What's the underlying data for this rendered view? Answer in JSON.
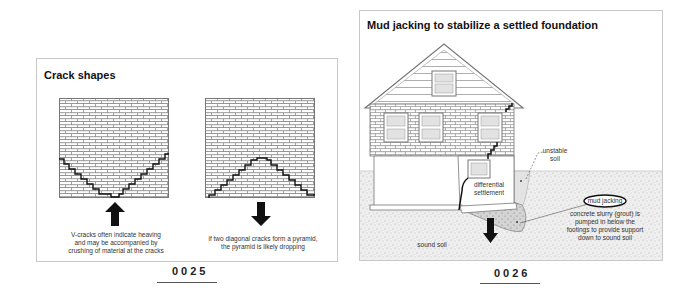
{
  "figures": [
    {
      "number": "0025",
      "title": "Crack shapes",
      "diagrams": [
        {
          "name": "v-crack",
          "arrow_direction": "up",
          "caption_lines": [
            "V-cracks often indicate heaving",
            "and may be accompanied by",
            "crushing of material at the cracks"
          ]
        },
        {
          "name": "pyramid-crack",
          "arrow_direction": "down",
          "caption_lines": [
            "if two diagonal cracks form a pyramid,",
            "the pyramid is likely dropping"
          ]
        }
      ]
    },
    {
      "number": "0026",
      "title": "Mud jacking to stabilize a settled foundation",
      "labels": {
        "unstable_soil": [
          "unstable",
          "soil"
        ],
        "differential_settlement": [
          "differential",
          "settlement"
        ],
        "mud_jacking": "mud jacking",
        "grout_note": [
          "concrete  slurry (grout) is",
          "pumped in below the",
          "footings to provide support",
          "down to sound soil"
        ],
        "sound_soil": "sound soil"
      }
    }
  ],
  "colors": {
    "panel_border": "#c9c9c9",
    "brick_line": "#8a8a8a",
    "crack": "#111111",
    "soil_fill": "#ececec",
    "grout_fill": "#d6d6d6",
    "window_fill": "#e2e2e2"
  }
}
